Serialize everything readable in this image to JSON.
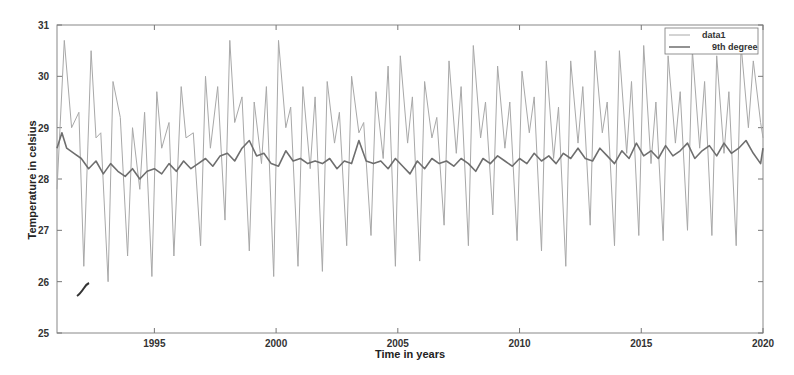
{
  "chart_data": {
    "type": "line",
    "title": "",
    "xlabel": "Time in years",
    "ylabel": "Temperature in celsius",
    "xlim": [
      1991,
      2020
    ],
    "ylim": [
      25,
      31
    ],
    "xticks": [
      1995,
      2000,
      2005,
      2010,
      2015,
      2020
    ],
    "yticks": [
      25,
      26,
      27,
      28,
      29,
      30,
      31
    ],
    "grid": false,
    "legend_position": "upper right",
    "legend": [
      "data1",
      "9th degree"
    ],
    "series": [
      {
        "name": "data1",
        "color": "#a8a8a8",
        "x": [
          1991.0,
          1991.3,
          1991.6,
          1991.9,
          1992.1,
          1992.4,
          1992.6,
          1992.8,
          1993.1,
          1993.3,
          1993.6,
          1993.9,
          1994.1,
          1994.4,
          1994.6,
          1994.9,
          1995.1,
          1995.3,
          1995.6,
          1995.8,
          1996.1,
          1996.3,
          1996.6,
          1996.9,
          1997.1,
          1997.3,
          1997.6,
          1997.9,
          1998.1,
          1998.3,
          1998.6,
          1998.9,
          1999.1,
          1999.4,
          1999.6,
          1999.9,
          2000.1,
          2000.4,
          2000.6,
          2000.9,
          2001.1,
          2001.4,
          2001.6,
          2001.9,
          2002.1,
          2002.4,
          2002.6,
          2002.9,
          2003.1,
          2003.4,
          2003.6,
          2003.9,
          2004.1,
          2004.4,
          2004.6,
          2004.9,
          2005.1,
          2005.4,
          2005.6,
          2005.9,
          2006.1,
          2006.4,
          2006.6,
          2006.9,
          2007.1,
          2007.4,
          2007.6,
          2007.9,
          2008.1,
          2008.4,
          2008.6,
          2008.9,
          2009.1,
          2009.4,
          2009.6,
          2009.9,
          2010.1,
          2010.4,
          2010.6,
          2010.9,
          2011.1,
          2011.4,
          2011.6,
          2011.9,
          2012.1,
          2012.4,
          2012.6,
          2012.9,
          2013.1,
          2013.4,
          2013.6,
          2013.9,
          2014.1,
          2014.4,
          2014.6,
          2014.9,
          2015.1,
          2015.4,
          2015.6,
          2015.9,
          2016.1,
          2016.4,
          2016.6,
          2016.9,
          2017.1,
          2017.4,
          2017.6,
          2017.9,
          2018.1,
          2018.4,
          2018.6,
          2018.9,
          2019.1,
          2019.4,
          2019.6,
          2019.9,
          2020.0
        ],
        "y": [
          27.8,
          30.7,
          29.0,
          29.3,
          26.3,
          30.5,
          28.8,
          28.9,
          26.0,
          29.9,
          29.2,
          26.5,
          29.0,
          27.8,
          29.3,
          26.1,
          29.7,
          28.6,
          29.1,
          26.5,
          29.8,
          28.8,
          28.9,
          26.7,
          30.0,
          28.6,
          29.8,
          27.2,
          30.7,
          29.1,
          29.6,
          26.6,
          29.5,
          28.3,
          29.8,
          26.1,
          30.7,
          29.0,
          29.4,
          26.3,
          29.8,
          28.2,
          29.6,
          26.2,
          29.9,
          28.7,
          29.3,
          26.7,
          30.0,
          28.9,
          29.1,
          26.9,
          29.7,
          28.4,
          30.2,
          26.3,
          30.4,
          28.7,
          29.6,
          26.4,
          29.9,
          28.8,
          29.2,
          27.1,
          30.3,
          28.5,
          29.8,
          26.7,
          30.6,
          28.8,
          29.5,
          27.3,
          30.2,
          28.6,
          29.5,
          26.8,
          30.1,
          28.9,
          29.6,
          26.6,
          30.3,
          28.4,
          29.4,
          26.3,
          30.3,
          28.7,
          29.8,
          27.1,
          30.5,
          28.9,
          29.5,
          26.7,
          30.5,
          28.5,
          29.9,
          26.9,
          30.6,
          28.3,
          29.5,
          26.8,
          30.4,
          28.7,
          29.7,
          27.0,
          30.5,
          28.6,
          29.9,
          26.9,
          30.4,
          28.5,
          29.7,
          26.7,
          30.6,
          29.0,
          30.3,
          29.1,
          28.8
        ]
      },
      {
        "name": "9th degree",
        "color": "#6e6e6e",
        "x": [
          1991.0,
          1991.2,
          1991.4,
          1991.7,
          1992.0,
          1992.3,
          1992.6,
          1992.9,
          1993.2,
          1993.5,
          1993.8,
          1994.1,
          1994.4,
          1994.7,
          1995.0,
          1995.3,
          1995.6,
          1995.9,
          1996.2,
          1996.5,
          1996.8,
          1997.1,
          1997.4,
          1997.7,
          1998.0,
          1998.3,
          1998.6,
          1998.9,
          1999.2,
          1999.5,
          1999.8,
          2000.1,
          2000.4,
          2000.7,
          2001.0,
          2001.3,
          2001.6,
          2001.9,
          2002.2,
          2002.5,
          2002.8,
          2003.1,
          2003.4,
          2003.7,
          2004.0,
          2004.3,
          2004.6,
          2004.9,
          2005.2,
          2005.5,
          2005.8,
          2006.1,
          2006.4,
          2006.7,
          2007.0,
          2007.3,
          2007.6,
          2007.9,
          2008.2,
          2008.5,
          2008.8,
          2009.1,
          2009.4,
          2009.7,
          2010.0,
          2010.3,
          2010.6,
          2010.9,
          2011.2,
          2011.5,
          2011.8,
          2012.1,
          2012.4,
          2012.7,
          2013.0,
          2013.3,
          2013.6,
          2013.9,
          2014.2,
          2014.5,
          2014.8,
          2015.1,
          2015.4,
          2015.7,
          2016.0,
          2016.3,
          2016.6,
          2016.9,
          2017.2,
          2017.5,
          2017.8,
          2018.1,
          2018.4,
          2018.7,
          2019.0,
          2019.3,
          2019.6,
          2019.9,
          2020.0
        ],
        "y": [
          28.6,
          28.9,
          28.6,
          28.5,
          28.4,
          28.2,
          28.35,
          28.1,
          28.3,
          28.15,
          28.05,
          28.2,
          28.0,
          28.15,
          28.2,
          28.1,
          28.3,
          28.15,
          28.35,
          28.2,
          28.3,
          28.4,
          28.25,
          28.45,
          28.5,
          28.35,
          28.6,
          28.75,
          28.45,
          28.5,
          28.3,
          28.25,
          28.55,
          28.35,
          28.4,
          28.3,
          28.35,
          28.3,
          28.4,
          28.2,
          28.35,
          28.3,
          28.75,
          28.35,
          28.3,
          28.35,
          28.2,
          28.4,
          28.25,
          28.1,
          28.35,
          28.2,
          28.4,
          28.3,
          28.35,
          28.25,
          28.4,
          28.3,
          28.15,
          28.4,
          28.3,
          28.45,
          28.35,
          28.25,
          28.4,
          28.3,
          28.5,
          28.35,
          28.45,
          28.3,
          28.5,
          28.4,
          28.6,
          28.4,
          28.35,
          28.6,
          28.45,
          28.3,
          28.55,
          28.4,
          28.7,
          28.45,
          28.55,
          28.4,
          28.65,
          28.45,
          28.55,
          28.7,
          28.4,
          28.55,
          28.65,
          28.45,
          28.7,
          28.5,
          28.6,
          28.75,
          28.5,
          28.3,
          28.6
        ]
      }
    ]
  },
  "axes": {
    "xlabel": "Time in years",
    "ylabel": "Temperature in celsius",
    "xtick_labels": [
      "1995",
      "2000",
      "2005",
      "2010",
      "2015",
      "2020"
    ],
    "ytick_labels": [
      "25",
      "26",
      "27",
      "28",
      "29",
      "30",
      "31"
    ]
  },
  "legend": {
    "items": [
      {
        "label": "data1",
        "color": "#a8a8a8"
      },
      {
        "label": "9th degree",
        "color": "#6e6e6e"
      }
    ]
  }
}
